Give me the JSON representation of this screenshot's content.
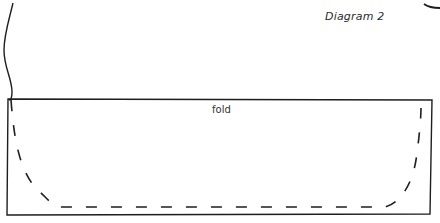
{
  "diagram": {
    "title": "Diagram 2",
    "fold_label": "fold",
    "colors": {
      "ink": "#1e1e1e",
      "paper": "#ffffff"
    },
    "elements": [
      {
        "name": "fabric-edge-wavy",
        "style": "solid"
      },
      {
        "name": "fold-rectangle",
        "style": "solid",
        "label": "fold"
      },
      {
        "name": "cutting-line",
        "style": "dashed",
        "shape": "U-curve"
      },
      {
        "name": "corner-arc",
        "style": "solid"
      }
    ]
  }
}
